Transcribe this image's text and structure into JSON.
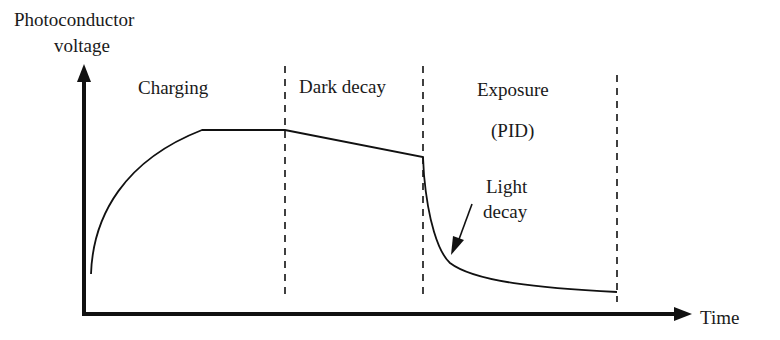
{
  "diagram": {
    "type": "photoconductor-voltage-vs-time",
    "y_axis_label_line1": "Photoconductor",
    "y_axis_label_line2": "voltage",
    "x_axis_label": "Time",
    "phases": [
      {
        "label": "Charging"
      },
      {
        "label": "Dark decay"
      },
      {
        "label_line1": "Exposure",
        "label_line2": "(PID)"
      }
    ],
    "annotation": {
      "line1": "Light",
      "line2": "decay"
    },
    "colors": {
      "line": "#111111",
      "background": "#ffffff"
    }
  }
}
